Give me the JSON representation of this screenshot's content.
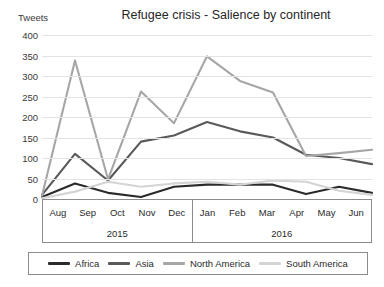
{
  "chart_data": {
    "type": "line",
    "title": "Refugee crisis - Salience by continent",
    "ylabel": "Tweets",
    "xlabel": "",
    "ylim": [
      0,
      400
    ],
    "y_ticks": [
      400,
      350,
      300,
      250,
      200,
      150,
      100,
      50,
      0
    ],
    "grid": true,
    "legend_position": "bottom",
    "categories": [
      "Aug",
      "Sep",
      "Oct",
      "Nov",
      "Dec",
      "Jan",
      "Feb",
      "Mar",
      "Apr",
      "May",
      "Jun"
    ],
    "category_groups": [
      {
        "label": "2015",
        "months": [
          "Aug",
          "Sep",
          "Oct",
          "Nov",
          "Dec"
        ]
      },
      {
        "label": "2016",
        "months": [
          "Jan",
          "Feb",
          "Mar",
          "Apr",
          "May",
          "Jun"
        ]
      }
    ],
    "series": [
      {
        "name": "Africa",
        "color": "#2b2b2b",
        "values": [
          5,
          38,
          15,
          5,
          30,
          35,
          35,
          35,
          12,
          30,
          15
        ]
      },
      {
        "name": "Asia",
        "color": "#595959",
        "values": [
          10,
          110,
          45,
          140,
          155,
          188,
          165,
          150,
          108,
          100,
          85
        ]
      },
      {
        "name": "North America",
        "color": "#a6a6a6",
        "values": [
          8,
          338,
          48,
          262,
          185,
          348,
          288,
          260,
          105,
          112,
          120
        ]
      },
      {
        "name": "South America",
        "color": "#d4d4d4",
        "values": [
          2,
          18,
          42,
          30,
          38,
          42,
          35,
          45,
          42,
          20,
          10
        ]
      }
    ]
  }
}
